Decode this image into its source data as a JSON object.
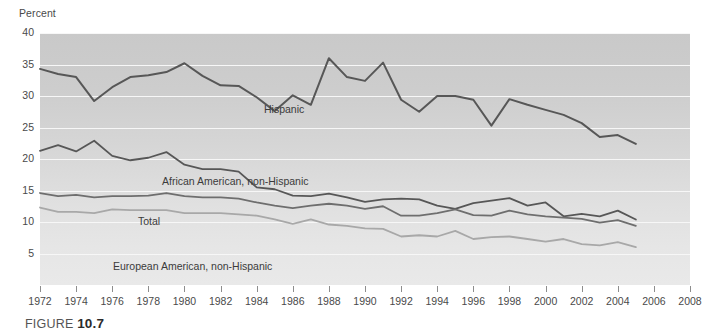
{
  "figure": {
    "caption_prefix": "FIGURE",
    "caption_number": "10.7"
  },
  "chart_data": {
    "type": "line",
    "title": "",
    "subtitle": "",
    "xlabel": "",
    "ylabel": "Percent",
    "ylim": [
      0,
      40
    ],
    "xlim": [
      1972,
      2008
    ],
    "grid": true,
    "gridlines_y": [
      5,
      10,
      15,
      20,
      25,
      30,
      35,
      40
    ],
    "legend_position": "inline-labels",
    "ytick_labels": [
      "5",
      "10",
      "15",
      "20",
      "25",
      "30",
      "35",
      "40"
    ],
    "ytick_values": [
      5,
      10,
      15,
      20,
      25,
      30,
      35,
      40
    ],
    "xtick_labels": [
      "1972",
      "1974",
      "1976",
      "1978",
      "1980",
      "1982",
      "1984",
      "1986",
      "1988",
      "1990",
      "1992",
      "1994",
      "1996",
      "1998",
      "2000",
      "2002",
      "2004",
      "2006",
      "2008"
    ],
    "xtick_values": [
      1972,
      1974,
      1976,
      1978,
      1980,
      1982,
      1984,
      1986,
      1988,
      1990,
      1992,
      1994,
      1996,
      1998,
      2000,
      2002,
      2004,
      2006,
      2008
    ],
    "x": [
      1972,
      1973,
      1974,
      1975,
      1976,
      1977,
      1978,
      1979,
      1980,
      1981,
      1982,
      1983,
      1984,
      1985,
      1986,
      1987,
      1988,
      1989,
      1990,
      1991,
      1992,
      1993,
      1994,
      1995,
      1996,
      1997,
      1998,
      1999,
      2000,
      2001,
      2002,
      2003,
      2004,
      2005
    ],
    "series": [
      {
        "name": "Hispanic",
        "color": "#575757",
        "width": 2.0,
        "values": [
          34.3,
          33.5,
          33.0,
          29.2,
          31.4,
          33.0,
          33.3,
          33.8,
          35.2,
          33.2,
          31.7,
          31.6,
          29.8,
          27.6,
          30.1,
          28.6,
          36.0,
          33.0,
          32.4,
          35.3,
          29.4,
          27.5,
          30.0,
          30.0,
          29.4,
          25.3,
          29.5,
          28.6,
          27.8,
          27.0,
          25.7,
          23.5,
          23.8,
          22.4
        ]
      },
      {
        "name": "African American, non-Hispanic",
        "color": "#575757",
        "width": 1.8,
        "values": [
          21.3,
          22.2,
          21.2,
          22.9,
          20.5,
          19.8,
          20.2,
          21.1,
          19.1,
          18.4,
          18.4,
          18.0,
          15.5,
          15.2,
          14.2,
          14.1,
          14.5,
          13.9,
          13.2,
          13.6,
          13.7,
          13.6,
          12.6,
          12.1,
          13.0,
          13.4,
          13.8,
          12.6,
          13.1,
          10.9,
          11.3,
          10.9,
          11.8,
          10.4
        ]
      },
      {
        "name": "Total",
        "color": "#6e6e6e",
        "width": 1.8,
        "values": [
          14.6,
          14.1,
          14.3,
          13.9,
          14.1,
          14.1,
          14.2,
          14.6,
          14.1,
          13.9,
          13.9,
          13.7,
          13.1,
          12.6,
          12.2,
          12.6,
          12.9,
          12.6,
          12.1,
          12.5,
          11.0,
          11.0,
          11.4,
          12.0,
          11.1,
          11.0,
          11.8,
          11.2,
          10.9,
          10.7,
          10.5,
          9.9,
          10.3,
          9.4
        ]
      },
      {
        "name": "European American, non-Hispanic",
        "color": "#a8a8a8",
        "width": 1.8,
        "values": [
          12.3,
          11.6,
          11.6,
          11.4,
          12.0,
          11.9,
          11.9,
          11.9,
          11.4,
          11.4,
          11.4,
          11.2,
          11.0,
          10.4,
          9.7,
          10.4,
          9.6,
          9.4,
          9.0,
          8.9,
          7.7,
          7.9,
          7.7,
          8.6,
          7.3,
          7.6,
          7.7,
          7.3,
          6.9,
          7.3,
          6.5,
          6.3,
          6.8,
          6.0
        ]
      }
    ],
    "annotations": [
      {
        "text": "Hispanic",
        "x": 1984.5,
        "y": 32.2
      },
      {
        "text": "African American, non-Hispanic",
        "x": 1977.8,
        "y": 21.6
      },
      {
        "text": "Total",
        "x": 1976.4,
        "y": 15.7
      },
      {
        "text": "European American, non-Hispanic",
        "x": 1974.9,
        "y": 12.6
      }
    ]
  }
}
